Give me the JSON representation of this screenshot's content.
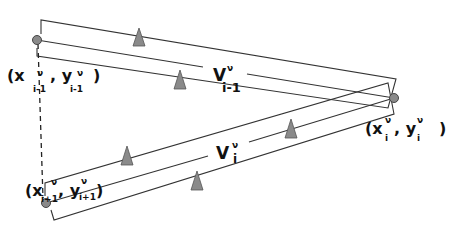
{
  "diagram": {
    "colors": {
      "stroke": "#333333",
      "node_fill": "#8a8a8a",
      "triangle_fill": "#8a8a8a",
      "background": "#ffffff"
    },
    "nodes": [
      {
        "id": "node-i-minus-1",
        "x": 37,
        "y": 40
      },
      {
        "id": "node-i",
        "x": 394,
        "y": 98
      },
      {
        "id": "node-i-plus-1",
        "x": 46,
        "y": 203
      }
    ],
    "labels": {
      "node_i_minus_1": {
        "open": "(x",
        "sub_x": "i-1",
        "sup_x": "ν",
        "comma": ", y",
        "sub_y": "i-1",
        "sup_y": "ν",
        "close": ")"
      },
      "node_i": {
        "open": "(x",
        "sub_x": "i",
        "sup_x": "ν",
        "comma": ", y",
        "sub_y": "i",
        "sup_y": "ν",
        "close": ")"
      },
      "node_i_plus_1": {
        "open": "(x",
        "sub_x": "i+1",
        "sup_x": "ν",
        "comma": ", y",
        "sub_y": "i+1",
        "sup_y": "ν",
        "close": ")"
      },
      "edge_top": {
        "base": "V",
        "sup": "ν",
        "sub": "i-1"
      },
      "edge_bottom": {
        "base": "V",
        "sup": "ν",
        "sub": "i"
      }
    },
    "edges": [
      {
        "name": "V_{i-1}",
        "from": "node-i-minus-1",
        "to": "node-i"
      },
      {
        "name": "V_i",
        "from": "node-i-plus-1",
        "to": "node-i"
      }
    ],
    "triangle_markers": 5,
    "dashed_connector": {
      "from": "node-i-minus-1",
      "to": "node-i-plus-1"
    }
  }
}
